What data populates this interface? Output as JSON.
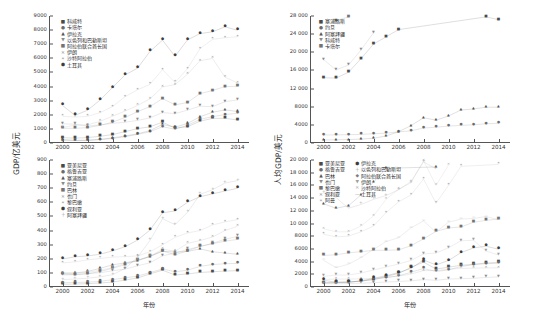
{
  "figure": {
    "xlabel": "年份",
    "ylabel_left": "GDP/亿美元",
    "ylabel_right": "人均GDP/美元"
  },
  "chart_data": [
    {
      "id": "tl",
      "type": "scatter",
      "title": "",
      "xlabel": "年份",
      "ylabel": "GDP/亿美元",
      "xlim": [
        1999,
        2015
      ],
      "ylim": [
        0,
        9000
      ],
      "xticks": [
        2000,
        2002,
        2004,
        2006,
        2008,
        2010,
        2012,
        2014
      ],
      "yticks": [
        0,
        1000,
        2000,
        3000,
        4000,
        5000,
        6000,
        7000,
        8000,
        9000
      ],
      "grid": false,
      "legend_position": "upper-left",
      "x": [
        2000,
        2001,
        2002,
        2003,
        2004,
        2005,
        2006,
        2007,
        2008,
        2009,
        2010,
        2011,
        2012,
        2013,
        2014
      ],
      "series": [
        {
          "name": "科威特",
          "marker": "square",
          "color": "#4a4a4a",
          "values": [
            376,
            346,
            383,
            476,
            597,
            806,
            1017,
            1147,
            1476,
            1059,
            1153,
            1544,
            1743,
            1746,
            1637
          ]
        },
        {
          "name": "卡塔尔",
          "marker": "circle",
          "color": "#6b6b6b",
          "values": [
            176,
            178,
            196,
            238,
            318,
            446,
            608,
            798,
            1152,
            976,
            1252,
            1676,
            1869,
            2016,
            2103
          ]
        },
        {
          "name": "伊拉克",
          "marker": "triangle-up",
          "color": "#565656",
          "values": [
            256,
            189,
            186,
            257,
            365,
            497,
            652,
            880,
            1318,
            1118,
            1384,
            1857,
            2181,
            2345,
            2235
          ]
        },
        {
          "name": "以色列和巴勒斯坦",
          "marker": "triangle-down",
          "color": "#8a8a8a",
          "values": [
            1360,
            1330,
            1200,
            1280,
            1390,
            1470,
            1600,
            1780,
            2160,
            2080,
            2330,
            2610,
            2570,
            2930,
            3050
          ]
        },
        {
          "name": "阿拉伯联合酋长国",
          "marker": "square",
          "color": "#737373",
          "values": [
            1040,
            1040,
            1090,
            1250,
            1470,
            1810,
            2220,
            2580,
            3150,
            2700,
            2870,
            3500,
            3720,
            4000,
            4015
          ]
        },
        {
          "name": "伊朗",
          "marker": "cross",
          "color": "#9a9a9a",
          "values": [
            1096,
            1263,
            1288,
            1530,
            1900,
            2260,
            2660,
            3130,
            3970,
            4140,
            4870,
            5830,
            5990,
            4670,
            4250
          ]
        },
        {
          "name": "沙特阿拉伯",
          "marker": "star",
          "color": "#a6a6a6",
          "values": [
            1890,
            1840,
            1890,
            2150,
            2580,
            3280,
            3770,
            4160,
            5200,
            4290,
            5270,
            6690,
            7340,
            7460,
            7530
          ]
        },
        {
          "name": "土耳其",
          "marker": "hexagon",
          "color": "#3c3c3c",
          "values": [
            2660,
            1960,
            2320,
            3040,
            3930,
            4820,
            5300,
            6490,
            7290,
            6140,
            7310,
            7750,
            7880,
            8230,
            7990
          ]
        }
      ]
    },
    {
      "id": "bl",
      "type": "scatter",
      "title": "",
      "xlabel": "年份",
      "ylabel": "GDP/亿美元",
      "xlim": [
        1999,
        2015
      ],
      "ylim": [
        0,
        900
      ],
      "xticks": [
        2000,
        2002,
        2004,
        2006,
        2008,
        2010,
        2012,
        2014
      ],
      "yticks": [
        0,
        100,
        200,
        300,
        400,
        500,
        600,
        700,
        800,
        900
      ],
      "grid": false,
      "legend_position": "upper-left",
      "x": [
        2000,
        2001,
        2002,
        2003,
        2004,
        2005,
        2006,
        2007,
        2008,
        2009,
        2010,
        2011,
        2012,
        2013,
        2014
      ],
      "series": [
        {
          "name": "亚美尼亚",
          "marker": "square",
          "color": "#4a4a4a",
          "values": [
            19,
            21,
            24,
            28,
            35,
            49,
            64,
            93,
            119,
            85,
            93,
            103,
            108,
            113,
            116
          ]
        },
        {
          "name": "格鲁吉亚",
          "marker": "circle",
          "color": "#6b6b6b",
          "values": [
            30,
            32,
            34,
            40,
            52,
            65,
            77,
            102,
            128,
            108,
            119,
            146,
            159,
            165,
            167
          ]
        },
        {
          "name": "塞浦路斯",
          "marker": "triangle-up",
          "color": "#565656",
          "values": [
            99,
            99,
            110,
            132,
            157,
            171,
            186,
            216,
            254,
            247,
            252,
            270,
            250,
            241,
            232
          ]
        },
        {
          "name": "约旦",
          "marker": "triangle-down",
          "color": "#8a8a8a",
          "values": [
            84,
            88,
            95,
            101,
            115,
            127,
            150,
            172,
            221,
            240,
            266,
            287,
            309,
            339,
            358
          ]
        },
        {
          "name": "巴林",
          "marker": "square",
          "color": "#737373",
          "values": [
            91,
            88,
            93,
            110,
            132,
            158,
            189,
            218,
            256,
            228,
            256,
            288,
            307,
            325,
            337
          ]
        },
        {
          "name": "也门",
          "marker": "cross",
          "color": "#9a9a9a",
          "values": [
            97,
            97,
            104,
            118,
            137,
            167,
            190,
            217,
            269,
            253,
            309,
            329,
            354,
            400,
            430
          ]
        },
        {
          "name": "黎巴嫩",
          "marker": "star",
          "color": "#a6a6a6",
          "values": [
            171,
            178,
            192,
            202,
            212,
            215,
            220,
            250,
            299,
            352,
            383,
            400,
            440,
            461,
            478
          ]
        },
        {
          "name": "叙利亚",
          "marker": "hexagon",
          "color": "#3c3c3c",
          "values": [
            198,
            214,
            220,
            232,
            256,
            285,
            332,
            404,
            526,
            539,
            600,
            640,
            660,
            680,
            700
          ]
        },
        {
          "name": "阿塞拜疆",
          "marker": "plus",
          "color": "#8f8f8f",
          "values": [
            52,
            57,
            62,
            72,
            87,
            131,
            210,
            330,
            484,
            442,
            529,
            656,
            689,
            737,
            754
          ]
        }
      ]
    },
    {
      "id": "tr",
      "type": "scatter",
      "title": "",
      "xlabel": "年份",
      "ylabel": "人均GDP/美元",
      "xlim": [
        1999,
        2015
      ],
      "ylim": [
        0,
        28000
      ],
      "xticks": [
        2000,
        2002,
        2004,
        2006,
        2008,
        2010,
        2012,
        2014
      ],
      "yticks": [
        0,
        4000,
        8000,
        12000,
        16000,
        20000,
        24000,
        28000
      ],
      "grid": false,
      "legend_position": "upper-left",
      "x": [
        2000,
        2001,
        2002,
        2003,
        2004,
        2005,
        2006,
        2007,
        2008,
        2009,
        2010,
        2011,
        2012,
        2013,
        2014
      ],
      "series": [
        {
          "name": "塞浦路斯",
          "marker": "square",
          "color": "#4a4a4a",
          "values": [
            14400,
            14300,
            15600,
            18600,
            21800,
            23400,
            25000,
            28400,
            32000,
            30700,
            30800,
            32300,
            29000,
            27800,
            27200
          ]
        },
        {
          "name": "约旦",
          "marker": "circle",
          "color": "#6b6b6b",
          "values": [
            1770,
            1790,
            1840,
            1880,
            2050,
            2160,
            2450,
            2680,
            3300,
            3480,
            3730,
            3880,
            4020,
            4240,
            4350
          ]
        },
        {
          "name": "阿塞拜疆",
          "marker": "triangle-up",
          "color": "#565656",
          "values": [
            650,
            700,
            760,
            870,
            1040,
            1550,
            2470,
            3840,
            5570,
            5030,
            5950,
            7280,
            7500,
            7900,
            7890
          ]
        },
        {
          "name": "科威特",
          "marker": "triangle-down",
          "color": "#8a8a8a",
          "values": [
            18400,
            16100,
            17200,
            20500,
            24300,
            31500,
            37800,
            40200,
            49100,
            33700,
            35400,
            45600,
            49900,
            48400,
            43600
          ]
        },
        {
          "name": "卡塔尔",
          "marker": "square",
          "color": "#737373",
          "values": [
            29400,
            27000,
            27800,
            31500,
            38100,
            48300,
            59000,
            62900,
            75000,
            53000,
            62000,
            73000,
            80000,
            83000,
            85000
          ]
        }
      ]
    },
    {
      "id": "br",
      "type": "scatter",
      "title": "",
      "xlabel": "年份",
      "ylabel": "人均GDP/美元",
      "xlim": [
        1999,
        2015
      ],
      "ylim": [
        0,
        20000
      ],
      "xticks": [
        2000,
        2002,
        2004,
        2006,
        2008,
        2010,
        2012,
        2014
      ],
      "yticks": [
        0,
        2000,
        4000,
        6000,
        8000,
        10000,
        12000,
        14000,
        16000,
        18000,
        20000
      ],
      "grid": false,
      "legend_position": "upper-left",
      "x": [
        2000,
        2001,
        2002,
        2003,
        2004,
        2005,
        2006,
        2007,
        2008,
        2009,
        2010,
        2011,
        2012,
        2013,
        2014
      ],
      "series": [
        {
          "name": "亚美尼亚",
          "marker": "square",
          "color": "#4a4a4a",
          "values": [
            620,
            690,
            780,
            930,
            1180,
            1640,
            2130,
            3090,
            3920,
            2820,
            3120,
            3420,
            3560,
            3780,
            3870
          ]
        },
        {
          "name": "格鲁吉亚",
          "marker": "circle",
          "color": "#6b6b6b",
          "values": [
            690,
            740,
            790,
            920,
            1190,
            1480,
            1760,
            2320,
            2920,
            2450,
            2690,
            3230,
            3530,
            3670,
            3740
          ]
        },
        {
          "name": "巴林",
          "marker": "triangle-up",
          "color": "#565656",
          "values": [
            13100,
            12400,
            12800,
            14500,
            16500,
            18700,
            20700,
            21900,
            23100,
            18900,
            20400,
            22300,
            23300,
            24000,
            24200
          ]
        },
        {
          "name": "也门",
          "marker": "triangle-down",
          "color": "#8a8a8a",
          "values": [
            540,
            530,
            550,
            600,
            670,
            790,
            870,
            970,
            1170,
            1060,
            1260,
            1310,
            1370,
            1510,
            1580
          ]
        },
        {
          "name": "黎巴嫩",
          "marker": "square",
          "color": "#737373",
          "values": [
            4970,
            5080,
            5380,
            5570,
            5770,
            5780,
            5840,
            6500,
            7580,
            8760,
            9300,
            9450,
            10200,
            10500,
            10700
          ]
        },
        {
          "name": "叙利亚",
          "marker": "cross",
          "color": "#9a9a9a",
          "values": [
            1190,
            1250,
            1250,
            1290,
            1380,
            1510,
            1720,
            2040,
            2590,
            2580,
            2810,
            2930,
            2970,
            3000,
            3020
          ]
        },
        {
          "name": "阿曼",
          "marker": "star",
          "color": "#a6a6a6",
          "values": [
            8300,
            7900,
            8000,
            8700,
            9600,
            11700,
            13400,
            14500,
            17000,
            13200,
            16000,
            19000,
            20200,
            20500,
            19300
          ]
        },
        {
          "name": "伊拉克",
          "marker": "hexagon",
          "color": "#3c3c3c",
          "values": [
            1050,
            760,
            730,
            980,
            1350,
            1780,
            2250,
            2930,
            4250,
            3480,
            4170,
            5420,
            6150,
            6420,
            5950
          ]
        },
        {
          "name": "以色列和巴勒斯坦",
          "marker": "plus",
          "color": "#8f8f8f",
          "values": [
            14800,
            14100,
            12400,
            13000,
            13800,
            14400,
            15300,
            16600,
            19700,
            18600,
            20400,
            22100,
            21200,
            23600,
            24100
          ]
        },
        {
          "name": "阿拉伯联合酋长国",
          "marker": "diamond",
          "color": "#7d7d7d",
          "values": [
            33300,
            31200,
            30100,
            32300,
            35000,
            40300,
            44400,
            45700,
            49800,
            36900,
            34300,
            39300,
            40900,
            42800,
            43000
          ]
        },
        {
          "name": "伊朗",
          "marker": "triangle-down",
          "color": "#9f9f9f",
          "values": [
            1660,
            1880,
            1890,
            2200,
            2680,
            3140,
            3620,
            4180,
            5200,
            5340,
            6180,
            7280,
            7360,
            5660,
            5050
          ]
        },
        {
          "name": "沙特阿拉伯",
          "marker": "cross",
          "color": "#b0b0b0",
          "values": [
            9200,
            8700,
            8700,
            9600,
            11200,
            13800,
            15400,
            16400,
            19900,
            16000,
            19200,
            23700,
            25400,
            25300,
            24900
          ]
        },
        {
          "name": "土耳其",
          "marker": "line",
          "color": "#a0a0a0",
          "values": [
            4200,
            3060,
            3580,
            4640,
            5920,
            7150,
            7760,
            9310,
            10400,
            8650,
            10200,
            10700,
            10800,
            11100,
            10600
          ]
        }
      ]
    }
  ]
}
